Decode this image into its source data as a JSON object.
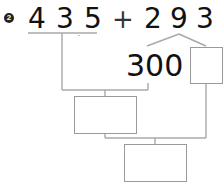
{
  "problem": {
    "number_badge": "2",
    "operand1": [
      "4",
      "3",
      "5"
    ],
    "operator": "+",
    "operand2": [
      "2",
      "9",
      "3"
    ],
    "partial_value": "300"
  },
  "colors": {
    "line": "#a8a8a8",
    "box_border": "#9a9a9a",
    "text": "#111111"
  }
}
